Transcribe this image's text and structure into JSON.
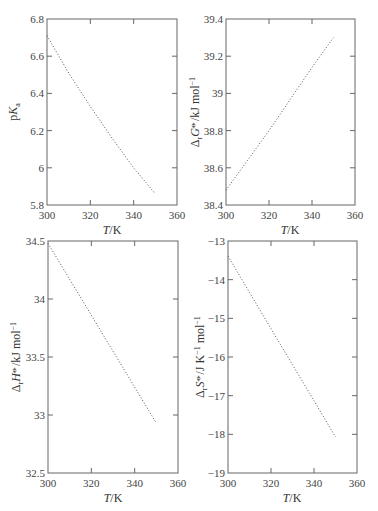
{
  "chart_data": [
    {
      "type": "line",
      "id": "pka",
      "title": "",
      "xlabel": "T/K",
      "ylabel": "pKa",
      "xlim": [
        300,
        360
      ],
      "ylim": [
        5.8,
        6.8
      ],
      "xticks": [
        300,
        320,
        340,
        360
      ],
      "yticks": [
        5.8,
        6,
        6.2,
        6.4,
        6.6,
        6.8
      ],
      "ytick_labels": [
        "5.8",
        "6",
        "6.2",
        "6.4",
        "6.6",
        "6.8"
      ],
      "xtick_labels": [
        "300",
        "320",
        "340",
        "360"
      ],
      "series": [
        {
          "name": "pKa",
          "style": "dotted",
          "x": [
            300,
            310,
            320,
            330,
            340,
            350
          ],
          "y": [
            6.71,
            6.51,
            6.33,
            6.16,
            6.0,
            5.86
          ]
        }
      ]
    },
    {
      "type": "line",
      "id": "delta-g",
      "title": "",
      "xlabel": "T/K",
      "ylabel": "ΔrG°/kJ mol⁻¹",
      "xlim": [
        300,
        360
      ],
      "ylim": [
        38.4,
        39.4
      ],
      "xticks": [
        300,
        320,
        340,
        360
      ],
      "yticks": [
        38.4,
        38.6,
        38.8,
        39,
        39.2,
        39.4
      ],
      "ytick_labels": [
        "38.4",
        "38.6",
        "38.8",
        "39",
        "39.2",
        "39.4"
      ],
      "xtick_labels": [
        "300",
        "320",
        "340",
        "360"
      ],
      "series": [
        {
          "name": "ΔrG°",
          "style": "dotted",
          "x": [
            300,
            310,
            320,
            330,
            340,
            350
          ],
          "y": [
            38.48,
            38.64,
            38.8,
            38.97,
            39.14,
            39.3
          ]
        }
      ]
    },
    {
      "type": "line",
      "id": "delta-h",
      "title": "",
      "xlabel": "T/K",
      "ylabel": "ΔrH°/kJ mol⁻¹",
      "xlim": [
        300,
        360
      ],
      "ylim": [
        32.5,
        34.5
      ],
      "xticks": [
        300,
        320,
        340,
        360
      ],
      "yticks": [
        32.5,
        33,
        33.5,
        34,
        34.5
      ],
      "ytick_labels": [
        "32.5",
        "33",
        "33.5",
        "34",
        "34.5"
      ],
      "xtick_labels": [
        "300",
        "320",
        "340",
        "360"
      ],
      "series": [
        {
          "name": "ΔrH°",
          "style": "dotted",
          "x": [
            300,
            310,
            320,
            330,
            340,
            350
          ],
          "y": [
            34.48,
            34.17,
            33.86,
            33.55,
            33.24,
            32.93
          ]
        }
      ]
    },
    {
      "type": "line",
      "id": "delta-s",
      "title": "",
      "xlabel": "T/K",
      "ylabel": "ΔrS°/J K⁻¹ mol⁻¹",
      "xlim": [
        300,
        360
      ],
      "ylim": [
        -19,
        -13
      ],
      "xticks": [
        300,
        320,
        340,
        360
      ],
      "yticks": [
        -19,
        -18,
        -17,
        -16,
        -15,
        -14,
        -13
      ],
      "ytick_labels": [
        "−19",
        "−18",
        "−17",
        "−16",
        "−15",
        "−14",
        "−13"
      ],
      "xtick_labels": [
        "300",
        "320",
        "340",
        "360"
      ],
      "series": [
        {
          "name": "ΔrS°",
          "style": "dotted",
          "x": [
            300,
            310,
            320,
            330,
            340,
            350
          ],
          "y": [
            -13.39,
            -14.33,
            -15.27,
            -16.2,
            -17.13,
            -18.07
          ]
        }
      ]
    }
  ]
}
